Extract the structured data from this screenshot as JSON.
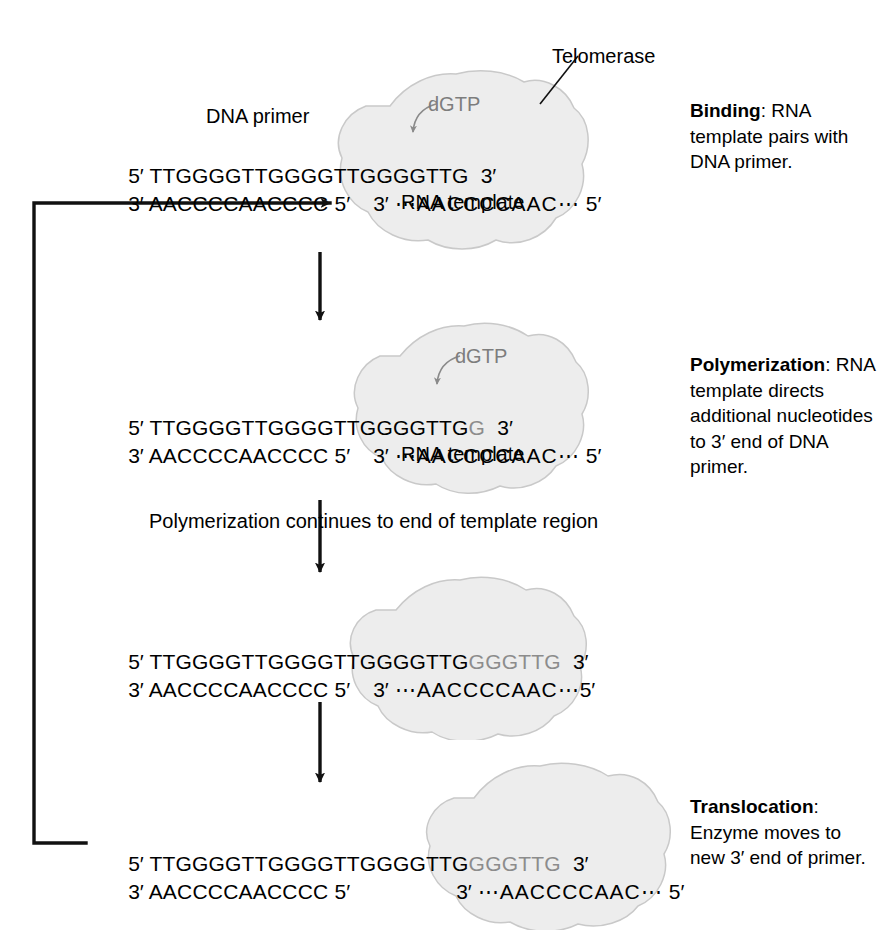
{
  "figure": {
    "enzyme_label": "Telomerase",
    "substrate_label": "dGTP",
    "template_label": "RNA template",
    "primer_label": "DNA primer",
    "loop_note": "Polymerization continues to end of template region",
    "colors": {
      "ink": "#000000",
      "new_nucleotides": "#8c8c8c",
      "blob_fill": "#ededed",
      "blob_stroke": "#c9c9c9"
    }
  },
  "strand_marks": {
    "five_prime": "5′",
    "three_prime": "3′",
    "ellipsis": "⋯"
  },
  "sequences": {
    "primer_top_fixed": "TTGGGGTTGGGGTTGGGGTTG",
    "primer_bottom_fixed": "AACCCCAACCCC",
    "rna_template": "AACCCCAAC",
    "added_step2": "G",
    "added_step3": "GGGTTG",
    "added_step4": "GGGTTG"
  },
  "steps": [
    {
      "id": "binding",
      "heading": "Binding",
      "heading_sep": ": ",
      "body": "RNA template pairs with DNA primer.",
      "top_strand_fixed": "TTGGGGTTGGGGTTGGGGTTG",
      "top_strand_new": "",
      "bottom_strand_fixed": "AACCCCAACCCC",
      "template_top_mark": "3′",
      "template_seq": "⋯AACCCCAAC⋯",
      "template_end_mark": "5′",
      "show_template_label": true,
      "show_dgtp": true,
      "show_telomerase_label": true,
      "show_primer_label": true
    },
    {
      "id": "polymerization",
      "heading": "Polymerization",
      "heading_sep": ": ",
      "body": "RNA template directs additional nucleotides to 3′ end of DNA primer.",
      "top_strand_fixed": "TTGGGGTTGGGGTTGGGGTTG",
      "top_strand_new": "G",
      "bottom_strand_fixed": "AACCCCAACCCC",
      "template_top_mark": "3′",
      "template_seq": "⋯AACCCCAAC⋯",
      "template_end_mark": "5′",
      "show_template_label": true,
      "show_dgtp": true,
      "show_telomerase_label": false,
      "show_primer_label": false
    },
    {
      "id": "extension-complete",
      "heading": "",
      "heading_sep": "",
      "body": "",
      "top_strand_fixed": "TTGGGGTTGGGGTTGGGGTTG",
      "top_strand_new": "GGGTTG",
      "bottom_strand_fixed": "AACCCCAACCCC",
      "template_top_mark": "3′",
      "template_seq": "⋯AACCCCAAC⋯",
      "template_end_mark": "5′",
      "show_template_label": false,
      "show_dgtp": false,
      "show_telomerase_label": false,
      "show_primer_label": false
    },
    {
      "id": "translocation",
      "heading": "Translocation",
      "heading_sep": ": ",
      "body": "Enzyme moves to new 3′ end of primer.",
      "top_strand_fixed": "TTGGGGTTGGGGTTGGGGTTG",
      "top_strand_new": "GGGTTG",
      "bottom_strand_fixed": "AACCCCAACCCC",
      "template_top_mark": "3′",
      "template_seq": "⋯AACCCCAAC⋯",
      "template_end_mark": "5′",
      "show_template_label": false,
      "show_dgtp": false,
      "show_telomerase_label": false,
      "show_primer_label": false
    }
  ]
}
